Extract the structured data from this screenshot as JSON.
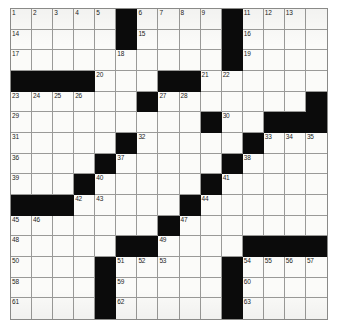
{
  "puzzle": {
    "type": "crossword-grid",
    "columns": 15,
    "rows": 15,
    "colors": {
      "block": "#0b0b0b",
      "open": "#fbfbf9",
      "gridline": "#9a9a98",
      "border": "#8a8a88",
      "number_text": "#1b1b1b"
    },
    "blocks": [
      [
        0,
        5
      ],
      [
        0,
        10
      ],
      [
        1,
        5
      ],
      [
        1,
        10
      ],
      [
        2,
        10
      ],
      [
        3,
        0
      ],
      [
        3,
        1
      ],
      [
        3,
        2
      ],
      [
        3,
        3
      ],
      [
        3,
        7
      ],
      [
        3,
        8
      ],
      [
        4,
        6
      ],
      [
        4,
        14
      ],
      [
        5,
        9
      ],
      [
        5,
        12
      ],
      [
        5,
        13
      ],
      [
        5,
        14
      ],
      [
        6,
        5
      ],
      [
        6,
        11
      ],
      [
        7,
        4
      ],
      [
        7,
        10
      ],
      [
        8,
        3
      ],
      [
        8,
        9
      ],
      [
        9,
        0
      ],
      [
        9,
        1
      ],
      [
        9,
        2
      ],
      [
        9,
        8
      ],
      [
        10,
        7
      ],
      [
        11,
        5
      ],
      [
        11,
        6
      ],
      [
        11,
        11
      ],
      [
        11,
        12
      ],
      [
        11,
        13
      ],
      [
        11,
        14
      ],
      [
        12,
        4
      ],
      [
        12,
        10
      ],
      [
        13,
        4
      ],
      [
        13,
        10
      ],
      [
        14,
        4
      ],
      [
        14,
        10
      ]
    ],
    "numbers": [
      {
        "row": 0,
        "col": 0,
        "n": "1"
      },
      {
        "row": 0,
        "col": 1,
        "n": "2"
      },
      {
        "row": 0,
        "col": 2,
        "n": "3"
      },
      {
        "row": 0,
        "col": 3,
        "n": "4"
      },
      {
        "row": 0,
        "col": 4,
        "n": "5"
      },
      {
        "row": 0,
        "col": 6,
        "n": "6"
      },
      {
        "row": 0,
        "col": 7,
        "n": "7"
      },
      {
        "row": 0,
        "col": 8,
        "n": "8"
      },
      {
        "row": 0,
        "col": 9,
        "n": "9"
      },
      {
        "row": 0,
        "col": 10,
        "n": "10"
      },
      {
        "row": 0,
        "col": 11,
        "n": "11"
      },
      {
        "row": 0,
        "col": 12,
        "n": "12"
      },
      {
        "row": 0,
        "col": 13,
        "n": "13"
      },
      {
        "row": 1,
        "col": 0,
        "n": "14"
      },
      {
        "row": 1,
        "col": 6,
        "n": "15"
      },
      {
        "row": 1,
        "col": 11,
        "n": "16"
      },
      {
        "row": 2,
        "col": 0,
        "n": "17"
      },
      {
        "row": 2,
        "col": 5,
        "n": "18"
      },
      {
        "row": 2,
        "col": 11,
        "n": "19"
      },
      {
        "row": 3,
        "col": 4,
        "n": "20"
      },
      {
        "row": 3,
        "col": 9,
        "n": "21"
      },
      {
        "row": 3,
        "col": 10,
        "n": "22"
      },
      {
        "row": 4,
        "col": 0,
        "n": "23"
      },
      {
        "row": 4,
        "col": 1,
        "n": "24"
      },
      {
        "row": 4,
        "col": 2,
        "n": "25"
      },
      {
        "row": 4,
        "col": 3,
        "n": "26"
      },
      {
        "row": 4,
        "col": 7,
        "n": "27"
      },
      {
        "row": 4,
        "col": 8,
        "n": "28"
      },
      {
        "row": 5,
        "col": 0,
        "n": "29"
      },
      {
        "row": 5,
        "col": 10,
        "n": "30"
      },
      {
        "row": 6,
        "col": 0,
        "n": "31"
      },
      {
        "row": 6,
        "col": 6,
        "n": "32"
      },
      {
        "row": 6,
        "col": 12,
        "n": "33"
      },
      {
        "row": 6,
        "col": 13,
        "n": "34"
      },
      {
        "row": 6,
        "col": 14,
        "n": "35"
      },
      {
        "row": 7,
        "col": 0,
        "n": "36"
      },
      {
        "row": 7,
        "col": 5,
        "n": "37"
      },
      {
        "row": 7,
        "col": 11,
        "n": "38"
      },
      {
        "row": 8,
        "col": 0,
        "n": "39"
      },
      {
        "row": 8,
        "col": 4,
        "n": "40"
      },
      {
        "row": 8,
        "col": 10,
        "n": "41"
      },
      {
        "row": 9,
        "col": 3,
        "n": "42"
      },
      {
        "row": 9,
        "col": 4,
        "n": "43"
      },
      {
        "row": 9,
        "col": 9,
        "n": "44"
      },
      {
        "row": 10,
        "col": 0,
        "n": "45"
      },
      {
        "row": 10,
        "col": 1,
        "n": "46"
      },
      {
        "row": 10,
        "col": 8,
        "n": "47"
      },
      {
        "row": 11,
        "col": 0,
        "n": "48"
      },
      {
        "row": 11,
        "col": 7,
        "n": "49"
      },
      {
        "row": 12,
        "col": 0,
        "n": "50"
      },
      {
        "row": 12,
        "col": 5,
        "n": "51"
      },
      {
        "row": 12,
        "col": 6,
        "n": "52"
      },
      {
        "row": 12,
        "col": 7,
        "n": "53"
      },
      {
        "row": 12,
        "col": 11,
        "n": "54"
      },
      {
        "row": 12,
        "col": 12,
        "n": "55"
      },
      {
        "row": 12,
        "col": 13,
        "n": "56"
      },
      {
        "row": 12,
        "col": 14,
        "n": "57"
      },
      {
        "row": 13,
        "col": 0,
        "n": "58"
      },
      {
        "row": 13,
        "col": 5,
        "n": "59"
      },
      {
        "row": 13,
        "col": 11,
        "n": "60"
      },
      {
        "row": 14,
        "col": 0,
        "n": "61"
      },
      {
        "row": 14,
        "col": 5,
        "n": "62"
      },
      {
        "row": 14,
        "col": 11,
        "n": "63"
      }
    ]
  }
}
